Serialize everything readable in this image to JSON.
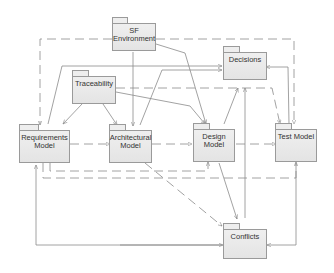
{
  "diagram": {
    "type": "uml-package-dependency-diagram",
    "colors": {
      "line": "#8a8a8a",
      "package_fill": "#e8e8e8",
      "package_border": "#9a9a9a",
      "text": "#333333"
    },
    "packages": {
      "sf_environment": {
        "line1": "SF",
        "line2": "Environment"
      },
      "decisions": {
        "line1": "Decisions",
        "line2": ""
      },
      "traceability": {
        "line1": "Traceability",
        "line2": ""
      },
      "requirements_model": {
        "line1": "Requirements",
        "line2": "Model"
      },
      "architectural_model": {
        "line1": "Architectural",
        "line2": "Model"
      },
      "design_model": {
        "line1": "Design",
        "line2": "Model"
      },
      "test_model": {
        "line1": "Test Model",
        "line2": ""
      },
      "conflicts": {
        "line1": "Conflicts",
        "line2": ""
      }
    },
    "dependencies": [
      {
        "from": "SF Environment",
        "to": "Requirements Model",
        "style": "dashed"
      },
      {
        "from": "SF Environment",
        "to": "Architectural Model",
        "style": "solid"
      },
      {
        "from": "SF Environment",
        "to": "Design Model",
        "style": "solid"
      },
      {
        "from": "SF Environment",
        "to": "Test Model",
        "style": "dashed"
      },
      {
        "from": "Traceability",
        "to": "Requirements Model",
        "style": "solid"
      },
      {
        "from": "Traceability",
        "to": "Architectural Model",
        "style": "solid"
      },
      {
        "from": "Traceability",
        "to": "Design Model",
        "style": "solid"
      },
      {
        "from": "Traceability",
        "to": "Test Model",
        "style": "dashed"
      },
      {
        "from": "Requirements Model",
        "to": "Decisions",
        "style": "solid"
      },
      {
        "from": "Architectural Model",
        "to": "Decisions",
        "style": "solid"
      },
      {
        "from": "Design Model",
        "to": "Decisions",
        "style": "solid"
      },
      {
        "from": "Test Model",
        "to": "Decisions",
        "style": "solid"
      },
      {
        "from": "Requirements Model",
        "to": "Architectural Model",
        "style": "dashed"
      },
      {
        "from": "Architectural Model",
        "to": "Design Model",
        "style": "dashed"
      },
      {
        "from": "Design Model",
        "to": "Test Model",
        "style": "dashed"
      },
      {
        "from": "Requirements Model",
        "to": "Design Model",
        "style": "dashed"
      },
      {
        "from": "Requirements Model",
        "to": "Test Model",
        "style": "dashed"
      },
      {
        "from": "Architectural Model",
        "to": "Conflicts",
        "style": "dashed"
      },
      {
        "from": "Design Model",
        "to": "Conflicts",
        "style": "solid"
      },
      {
        "from": "Decisions",
        "to": "Conflicts",
        "style": "solid"
      },
      {
        "from": "Requirements Model",
        "to": "Conflicts",
        "style": "solid"
      },
      {
        "from": "Test Model",
        "to": "Conflicts",
        "style": "solid"
      }
    ]
  }
}
